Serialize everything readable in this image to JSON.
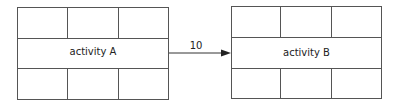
{
  "diagram": {
    "nodes": [
      {
        "id": "A",
        "label": "activity A"
      },
      {
        "id": "B",
        "label": "activity B"
      }
    ],
    "edges": [
      {
        "from": "A",
        "to": "B",
        "label": "10"
      }
    ],
    "colors": {
      "line": "#555555",
      "text": "#222222"
    }
  }
}
